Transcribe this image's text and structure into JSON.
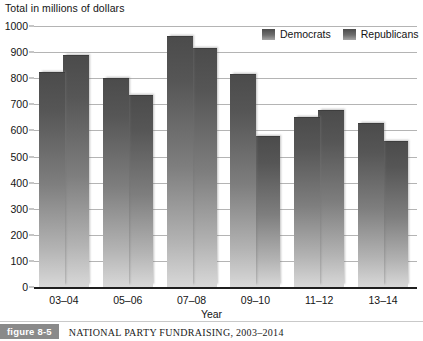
{
  "figure": {
    "badge": "figure 8-5",
    "caption": "NATIONAL PARTY FUNDRAISING, 2003–2014"
  },
  "legend": {
    "items": [
      {
        "label": "Democrats",
        "color": "#5a5a5a"
      },
      {
        "label": "Republicans",
        "color": "#5a5a5a"
      }
    ]
  },
  "chart_data": {
    "type": "bar",
    "title": "",
    "ylabel": "Total in millions of dollars",
    "xlabel": "Year",
    "categories": [
      "03–04",
      "05–06",
      "07–08",
      "09–10",
      "11–12",
      "13–14"
    ],
    "series": [
      {
        "name": "Democrats",
        "values": [
          824,
          800,
          960,
          815,
          650,
          628
        ]
      },
      {
        "name": "Republicans",
        "values": [
          890,
          735,
          915,
          580,
          680,
          558
        ]
      }
    ],
    "ylim": [
      0,
      1000
    ],
    "yticks": [
      0,
      100,
      200,
      300,
      400,
      500,
      600,
      700,
      800,
      900,
      1000
    ],
    "ytick_labels": [
      "0",
      "100",
      "200",
      "300",
      "400",
      "500",
      "600",
      "700",
      "800",
      "900",
      "1000"
    ],
    "grid": true,
    "legend_position": "top-right"
  }
}
